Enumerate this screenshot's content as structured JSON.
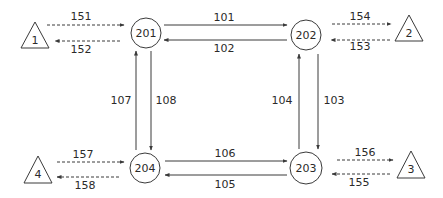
{
  "colors": {
    "stroke": "#3a3a3a",
    "text": "#2a2a2a",
    "background": "#ffffff"
  },
  "nodes": [
    {
      "id": "201",
      "label": "201",
      "cx": 146,
      "cy": 33,
      "r": 15
    },
    {
      "id": "202",
      "label": "202",
      "cx": 306,
      "cy": 35,
      "r": 15
    },
    {
      "id": "203",
      "label": "203",
      "cx": 306,
      "cy": 168,
      "r": 16
    },
    {
      "id": "204",
      "label": "204",
      "cx": 145,
      "cy": 168,
      "r": 15
    }
  ],
  "terminals": [
    {
      "id": "1",
      "label": "1",
      "points": "35,22 21,48 49,48",
      "tx": 35,
      "ty": 44
    },
    {
      "id": "2",
      "label": "2",
      "points": "409,15 395,41 423,41",
      "tx": 409,
      "ty": 37
    },
    {
      "id": "3",
      "label": "3",
      "points": "411,151 397,178 425,178",
      "tx": 411,
      "ty": 173
    },
    {
      "id": "4",
      "label": "4",
      "points": "38,156 24,183 52,183",
      "tx": 38,
      "ty": 178
    }
  ],
  "edges": {
    "solid": [
      {
        "label": "101",
        "from": "201",
        "to": "202",
        "x1": 164,
        "y1": 25,
        "x2": 287,
        "y2": 25,
        "lx": 224,
        "ly": 21
      },
      {
        "label": "102",
        "from": "202",
        "to": "201",
        "x1": 287,
        "y1": 40,
        "x2": 164,
        "y2": 40,
        "lx": 224,
        "ly": 52
      },
      {
        "label": "103",
        "from": "202",
        "to": "203",
        "x1": 318,
        "y1": 54,
        "x2": 318,
        "y2": 149,
        "lx": 334,
        "ly": 104
      },
      {
        "label": "104",
        "from": "203",
        "to": "202",
        "x1": 299,
        "y1": 149,
        "x2": 299,
        "y2": 54,
        "lx": 282,
        "ly": 104
      },
      {
        "label": "105",
        "from": "203",
        "to": "204",
        "x1": 287,
        "y1": 175,
        "x2": 165,
        "y2": 175,
        "lx": 225,
        "ly": 188
      },
      {
        "label": "106",
        "from": "204",
        "to": "203",
        "x1": 165,
        "y1": 161,
        "x2": 287,
        "y2": 161,
        "lx": 225,
        "ly": 157
      },
      {
        "label": "107",
        "from": "204",
        "to": "201",
        "x1": 136,
        "y1": 150,
        "x2": 136,
        "y2": 51,
        "lx": 121,
        "ly": 104
      },
      {
        "label": "108",
        "from": "201",
        "to": "204",
        "x1": 151,
        "y1": 51,
        "x2": 151,
        "y2": 150,
        "lx": 166,
        "ly": 104
      }
    ],
    "dashed": [
      {
        "label": "151",
        "from": "1",
        "to": "201",
        "x1": 47,
        "y1": 25,
        "x2": 124,
        "y2": 25,
        "lx": 81,
        "ly": 20
      },
      {
        "label": "152",
        "from": "201",
        "to": "1",
        "x1": 120,
        "y1": 41,
        "x2": 55,
        "y2": 41,
        "lx": 81,
        "ly": 53
      },
      {
        "label": "153",
        "from": "2",
        "to": "202",
        "x1": 390,
        "y1": 40,
        "x2": 331,
        "y2": 40,
        "lx": 360,
        "ly": 50
      },
      {
        "label": "154",
        "from": "202",
        "to": "2",
        "x1": 332,
        "y1": 24,
        "x2": 391,
        "y2": 24,
        "lx": 360,
        "ly": 20
      },
      {
        "label": "155",
        "from": "3",
        "to": "203",
        "x1": 390,
        "y1": 174,
        "x2": 332,
        "y2": 174,
        "lx": 359,
        "ly": 186
      },
      {
        "label": "156",
        "from": "203",
        "to": "3",
        "x1": 337,
        "y1": 160,
        "x2": 393,
        "y2": 160,
        "lx": 365,
        "ly": 156
      },
      {
        "label": "157",
        "from": "4",
        "to": "204",
        "x1": 57,
        "y1": 162,
        "x2": 124,
        "y2": 162,
        "lx": 83,
        "ly": 158
      },
      {
        "label": "158",
        "from": "204",
        "to": "4",
        "x1": 119,
        "y1": 177,
        "x2": 57,
        "y2": 177,
        "lx": 85,
        "ly": 189
      }
    ]
  }
}
